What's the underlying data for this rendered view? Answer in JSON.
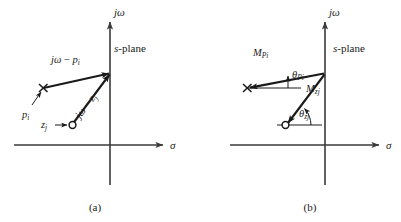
{
  "figure": {
    "type": "pole-zero-vector-diagram",
    "background_color": "#ffffff",
    "ink_color": "#1a1a1a",
    "axis_color": "#555555",
    "panels": [
      {
        "id": "a",
        "caption": "(a)",
        "plane_label": "s-plane",
        "plane_label_italic_part": "s",
        "plane_label_rest": "-plane",
        "axis_vertical_label": "jω",
        "axis_horizontal_label": "σ",
        "markers": [
          {
            "name": "pole-marker",
            "glyph": "x",
            "label": "p",
            "subscript": "i"
          },
          {
            "name": "zero-marker",
            "glyph": "o",
            "label": "z",
            "subscript": "j"
          }
        ],
        "vectors": [
          {
            "name": "pole-vector",
            "label_main": "jω",
            "label_minus": "−",
            "label_term": "p",
            "label_sub": "i",
            "label_full": "jω − p i",
            "direction": "pole-to-jw-axis"
          },
          {
            "name": "zero-vector",
            "label_main": "jω",
            "label_minus": "−",
            "label_term": "z",
            "label_sub": "j",
            "label_full": "jω − z j",
            "direction": "zero-to-jw-axis"
          }
        ]
      },
      {
        "id": "b",
        "caption": "(b)",
        "plane_label": "s-plane",
        "plane_label_italic_part": "s",
        "plane_label_rest": "-plane",
        "axis_vertical_label": "jω",
        "axis_horizontal_label": "σ",
        "markers": [
          {
            "name": "pole-marker",
            "glyph": "x"
          },
          {
            "name": "zero-marker",
            "glyph": "o"
          }
        ],
        "magnitudes": [
          {
            "name": "pole-magnitude",
            "symbol": "M",
            "subscript": "Pi"
          },
          {
            "name": "zero-magnitude",
            "symbol": "M",
            "subscript": "zj"
          }
        ],
        "angles": [
          {
            "name": "pole-angle",
            "symbol": "θ",
            "subscript": "Pi"
          },
          {
            "name": "zero-angle",
            "symbol": "θ",
            "subscript": "zj"
          }
        ]
      }
    ]
  }
}
